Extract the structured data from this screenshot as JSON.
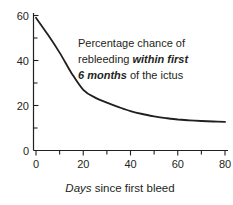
{
  "figure": {
    "background": "#ffffff",
    "ink_color": "#231f20"
  },
  "annotation": {
    "line1": "Percentage chance of",
    "line2_normal": "rebleeding ",
    "line2_bold_italic": "within first",
    "line3_bold_italic": "6 months",
    "line3_normal": " of the ictus"
  },
  "x_axis": {
    "title_italic": "Days",
    "title_rest": " since first bleed"
  },
  "chart_data": {
    "type": "line",
    "title": "",
    "annotation_text": "Percentage chance of rebleeding within first 6 months of the ictus",
    "xlabel": "Days since first bleed",
    "ylabel": "",
    "xlim": [
      0,
      80
    ],
    "ylim": [
      0,
      60
    ],
    "grid": false,
    "legend": false,
    "x_ticks_major": [
      0,
      20,
      40,
      60,
      80
    ],
    "x_ticks_minor": [
      10,
      30,
      50,
      70
    ],
    "x_tick_labels": [
      "0",
      "20",
      "40",
      "60",
      "80"
    ],
    "y_ticks_major": [
      0,
      20,
      40,
      60
    ],
    "y_ticks_minor": [
      10,
      30,
      50
    ],
    "y_tick_labels": [
      "0",
      "20",
      "40",
      "60"
    ],
    "line_color": "#231f20",
    "series": [
      {
        "name": "rebleeding-risk-percent",
        "x": [
          0,
          5,
          10,
          15,
          20,
          25,
          30,
          35,
          40,
          45,
          50,
          55,
          60,
          65,
          70,
          75,
          80
        ],
        "y": [
          59,
          51.5,
          43.5,
          34.5,
          27,
          23.5,
          21.3,
          19.3,
          17.5,
          16.2,
          15.2,
          14.4,
          13.8,
          13.4,
          13.1,
          12.9,
          12.7
        ]
      }
    ]
  }
}
